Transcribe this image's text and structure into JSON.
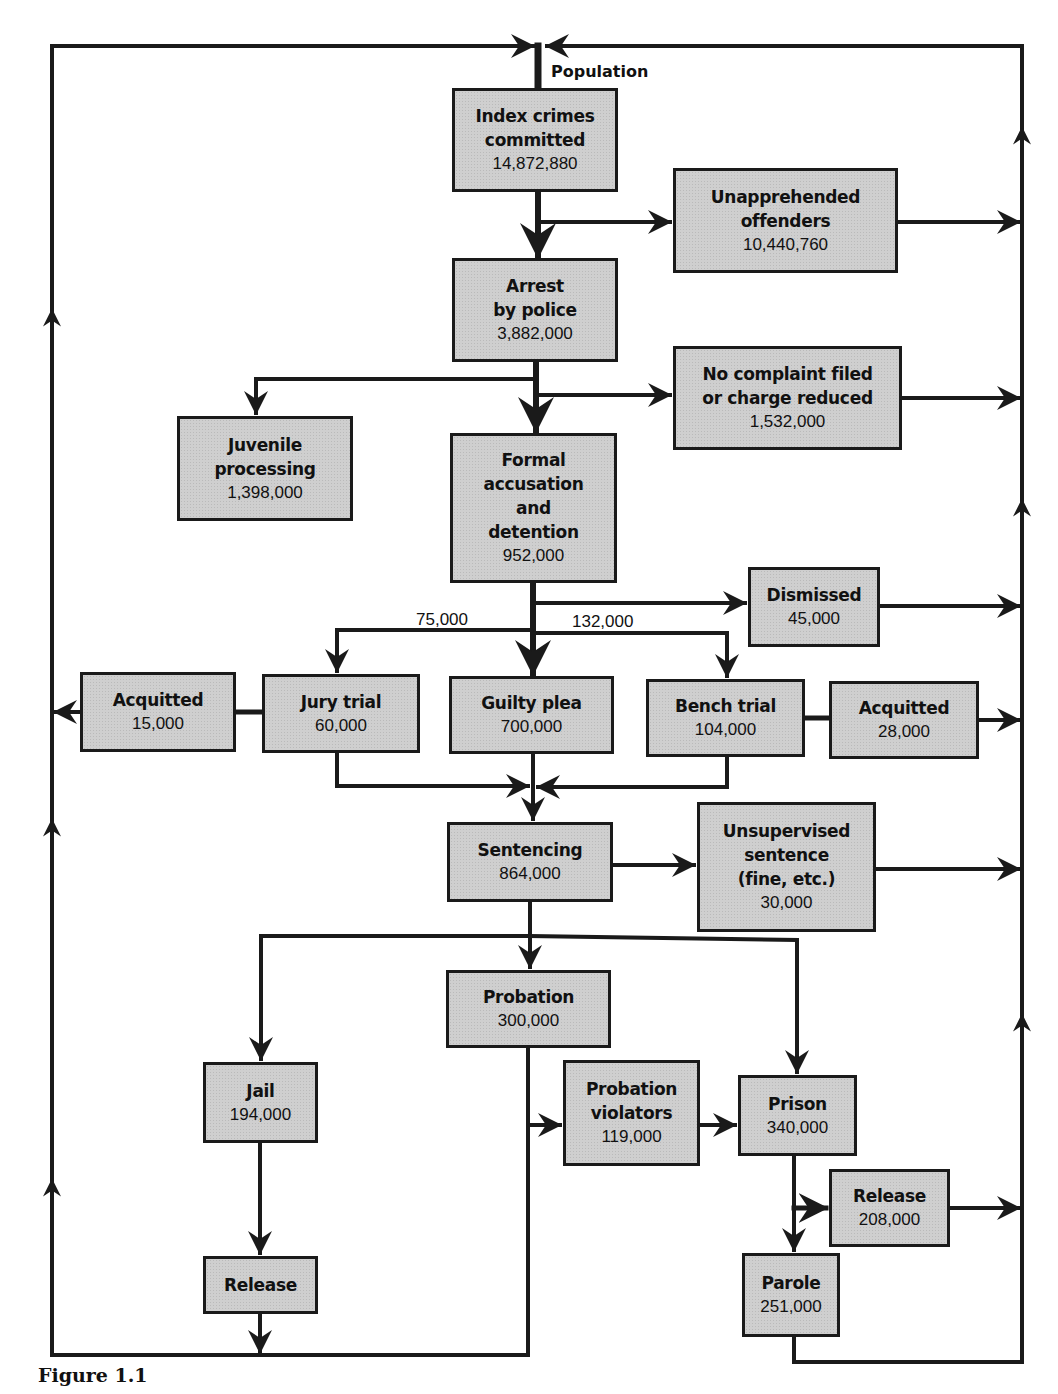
{
  "figure": {
    "caption": "Figure 1.1",
    "top_label": "Population"
  },
  "nodes": {
    "index_crimes": {
      "title": "Index crimes\ncommitted",
      "value": "14,872,880"
    },
    "unapprehended": {
      "title": "Unapprehended\noffenders",
      "value": "10,440,760"
    },
    "arrest": {
      "title": "Arrest\nby police",
      "value": "3,882,000"
    },
    "no_complaint": {
      "title": "No complaint filed\nor charge reduced",
      "value": "1,532,000"
    },
    "juvenile": {
      "title": "Juvenile\nprocessing",
      "value": "1,398,000"
    },
    "formal_accusation": {
      "title": "Formal\naccusation\nand\ndetention",
      "value": "952,000"
    },
    "dismissed": {
      "title": "Dismissed",
      "value": "45,000"
    },
    "acquitted_jury": {
      "title": "Acquitted",
      "value": "15,000"
    },
    "jury_trial": {
      "title": "Jury trial",
      "value": "60,000"
    },
    "guilty_plea": {
      "title": "Guilty plea",
      "value": "700,000"
    },
    "bench_trial": {
      "title": "Bench trial",
      "value": "104,000"
    },
    "acquitted_bench": {
      "title": "Acquitted",
      "value": "28,000"
    },
    "sentencing": {
      "title": "Sentencing",
      "value": "864,000"
    },
    "unsupervised": {
      "title": "Unsupervised\nsentence\n(fine, etc.)",
      "value": "30,000"
    },
    "probation": {
      "title": "Probation",
      "value": "300,000"
    },
    "jail": {
      "title": "Jail",
      "value": "194,000"
    },
    "probation_violators": {
      "title": "Probation\nviolators",
      "value": "119,000"
    },
    "prison": {
      "title": "Prison",
      "value": "340,000"
    },
    "release_prison": {
      "title": "Release",
      "value": "208,000"
    },
    "parole": {
      "title": "Parole",
      "value": "251,000"
    },
    "release_jail": {
      "title": "Release",
      "value": ""
    }
  },
  "edge_labels": {
    "to_jury_trial": "75,000",
    "to_bench_trial": "132,000"
  },
  "colors": {
    "box_fill": "#cfcfcf",
    "line": "#1a1a1a",
    "background": "#ffffff"
  }
}
